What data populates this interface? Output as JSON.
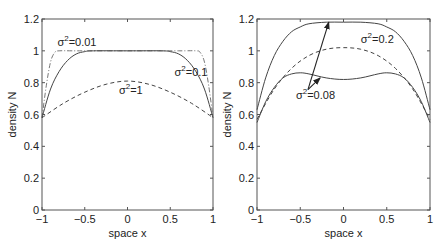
{
  "chart_data": [
    {
      "type": "line",
      "panel": "left",
      "title": "",
      "xlabel": "space x",
      "ylabel": "density N",
      "xlim": [
        -1,
        1
      ],
      "ylim": [
        0,
        1.2
      ],
      "xticks": [
        "-1",
        "-0.5",
        "0",
        "0.5",
        "1"
      ],
      "yticks": [
        "0",
        "0.2",
        "0.4",
        "0.6",
        "0.8",
        "1",
        "1.2"
      ],
      "grid": false,
      "annotations": [
        {
          "text": "σ²=0.01",
          "x": -0.82,
          "y": 1.03
        },
        {
          "text": "σ²=0.1",
          "x": 0.55,
          "y": 0.84
        },
        {
          "text": "σ²=1",
          "x": -0.1,
          "y": 0.73
        }
      ],
      "series": [
        {
          "name": "σ²=0.01",
          "style": "dash-dot",
          "x": [
            -1,
            -0.95,
            -0.9,
            -0.85,
            -0.8,
            -0.6,
            0,
            0.6,
            0.8,
            0.85,
            0.9,
            0.95,
            1
          ],
          "y": [
            0.58,
            0.78,
            0.93,
            0.99,
            1.0,
            1.0,
            1.0,
            1.0,
            1.0,
            0.99,
            0.93,
            0.78,
            0.58
          ]
        },
        {
          "name": "σ²=0.1",
          "style": "solid",
          "x": [
            -1,
            -0.9,
            -0.8,
            -0.7,
            -0.6,
            -0.5,
            -0.4,
            0,
            0.4,
            0.5,
            0.6,
            0.7,
            0.8,
            0.9,
            1
          ],
          "y": [
            0.58,
            0.76,
            0.87,
            0.94,
            0.98,
            0.995,
            1.0,
            1.0,
            1.0,
            0.995,
            0.98,
            0.94,
            0.87,
            0.76,
            0.58
          ]
        },
        {
          "name": "σ²=1",
          "style": "dashed",
          "x": [
            -1,
            -0.75,
            -0.5,
            -0.25,
            0,
            0.25,
            0.5,
            0.75,
            1
          ],
          "y": [
            0.58,
            0.67,
            0.74,
            0.79,
            0.81,
            0.79,
            0.74,
            0.67,
            0.58
          ]
        }
      ]
    },
    {
      "type": "line",
      "panel": "right",
      "title": "",
      "xlabel": "space x",
      "ylabel": "density N",
      "xlim": [
        -1,
        1
      ],
      "ylim": [
        0,
        1.2
      ],
      "xticks": [
        "-1",
        "-0.5",
        "0",
        "0.5",
        "1"
      ],
      "yticks": [
        "0",
        "0.2",
        "0.4",
        "0.6",
        "0.8",
        "1",
        "1.2"
      ],
      "grid": false,
      "annotations": [
        {
          "text": "σ²=0.2",
          "x": 0.2,
          "y": 1.05
        },
        {
          "text": "σ²=0.08",
          "x": -0.55,
          "y": 0.7,
          "arrows_to": [
            [
              -0.17,
              1.18
            ],
            [
              -0.27,
              0.83
            ]
          ]
        }
      ],
      "series": [
        {
          "name": "σ²=0.08 (upper)",
          "style": "solid",
          "x": [
            -1,
            -0.9,
            -0.8,
            -0.7,
            -0.6,
            -0.5,
            -0.4,
            -0.2,
            0,
            0.2,
            0.4,
            0.5,
            0.6,
            0.7,
            0.8,
            0.9,
            1
          ],
          "y": [
            0.63,
            0.83,
            0.97,
            1.06,
            1.12,
            1.15,
            1.17,
            1.18,
            1.18,
            1.18,
            1.17,
            1.15,
            1.12,
            1.06,
            0.97,
            0.83,
            0.63
          ]
        },
        {
          "name": "σ²=0.2",
          "style": "dashed",
          "x": [
            -1,
            -0.8,
            -0.6,
            -0.4,
            -0.2,
            0,
            0.2,
            0.4,
            0.6,
            0.8,
            1
          ],
          "y": [
            0.57,
            0.76,
            0.89,
            0.97,
            1.01,
            1.02,
            1.01,
            0.97,
            0.89,
            0.76,
            0.57
          ]
        },
        {
          "name": "σ²=0.08 (lower)",
          "style": "solid",
          "x": [
            -1,
            -0.9,
            -0.8,
            -0.7,
            -0.6,
            -0.5,
            -0.4,
            -0.2,
            0,
            0.2,
            0.4,
            0.5,
            0.6,
            0.7,
            0.8,
            0.9,
            1
          ],
          "y": [
            0.55,
            0.68,
            0.77,
            0.83,
            0.855,
            0.862,
            0.855,
            0.83,
            0.82,
            0.83,
            0.855,
            0.862,
            0.855,
            0.83,
            0.77,
            0.68,
            0.55
          ]
        }
      ]
    }
  ]
}
